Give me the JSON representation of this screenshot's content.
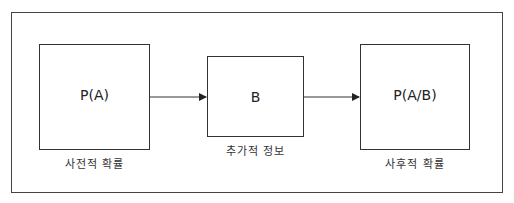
{
  "diagram": {
    "nodes": [
      {
        "id": "prior",
        "label": "P(A)",
        "caption": "사전적 확률"
      },
      {
        "id": "info",
        "label": "B",
        "caption": "추가적 정보"
      },
      {
        "id": "posterior",
        "label": "P(A/B)",
        "caption": "사후적 확률"
      }
    ],
    "edges": [
      {
        "from": "prior",
        "to": "info"
      },
      {
        "from": "info",
        "to": "posterior"
      }
    ],
    "colors": {
      "stroke": "#333333",
      "background": "#ffffff"
    }
  }
}
